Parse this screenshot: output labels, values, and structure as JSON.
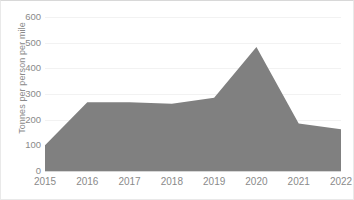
{
  "chart_data": {
    "type": "area",
    "title": "",
    "subtitle": "",
    "xlabel": "",
    "ylabel": "Tonnes per person per mile",
    "categories": [
      "2015",
      "2016",
      "2017",
      "2018",
      "2019",
      "2020",
      "2021",
      "2022"
    ],
    "values": [
      100,
      268,
      268,
      262,
      285,
      483,
      185,
      163
    ],
    "series": [
      {
        "name": "Tonnes per person per mile",
        "values": [
          100,
          268,
          268,
          262,
          285,
          483,
          185,
          163
        ]
      }
    ],
    "ylim": [
      0,
      600
    ],
    "y_ticks": [
      0,
      100,
      200,
      300,
      400,
      500,
      600
    ],
    "y_tick_labels": [
      "0",
      "100",
      "200",
      "300",
      "400",
      "500",
      "600"
    ],
    "x_tick_labels": [
      "2015",
      "2016",
      "2017",
      "2018",
      "2019",
      "2020",
      "2021",
      "2022"
    ],
    "grid": true,
    "legend": false,
    "legend_position": "none",
    "colors": {
      "area_fill": "#808080",
      "gridline": "#f2f2f2",
      "axis_line": "#d6d6d6",
      "tick_label": "#8a8a8a",
      "axis_title": "#8a8a8a",
      "background": "#ffffff",
      "frame": "#e9e9e9"
    }
  }
}
